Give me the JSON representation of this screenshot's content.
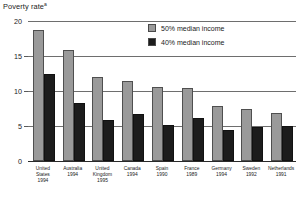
{
  "chart_data": {
    "type": "bar",
    "title": "Poverty rate",
    "title_superscript": "a",
    "xlabel": "",
    "ylabel": "Poverty rate",
    "ylim": [
      0,
      20
    ],
    "yticks": [
      0,
      5,
      10,
      15,
      20
    ],
    "ytick_labels": [
      "0",
      "5",
      "10",
      "15",
      "20"
    ],
    "grid": true,
    "legend_position": "top-right",
    "categories": [
      "United States 1994",
      "Australia 1994",
      "United Kingdom 1995",
      "Canada 1994",
      "Spain 1990",
      "France 1989",
      "Germany 1994",
      "Sweden 1992",
      "Netherlands 1991"
    ],
    "category_lines": [
      [
        "United",
        "States",
        "1994"
      ],
      [
        "Australia",
        "1994"
      ],
      [
        "United",
        "Kingdom",
        "1995"
      ],
      [
        "Canada",
        "1994"
      ],
      [
        "Spain",
        "1990"
      ],
      [
        "France",
        "1989"
      ],
      [
        "Germany",
        "1994"
      ],
      [
        "Sweden",
        "1992"
      ],
      [
        "Netherlands",
        "1991"
      ]
    ],
    "series": [
      {
        "name": "50% median income",
        "color": "#9a9a9a",
        "values": [
          18.7,
          15.8,
          12.0,
          11.4,
          10.6,
          10.5,
          7.9,
          7.5,
          6.9
        ]
      },
      {
        "name": "40% median income",
        "color": "#1c1c1c",
        "values": [
          12.5,
          8.3,
          5.9,
          6.7,
          5.2,
          6.1,
          4.4,
          4.9,
          5.0
        ]
      }
    ]
  },
  "legend": {
    "items": [
      {
        "label": "50% median income",
        "swatch": "light"
      },
      {
        "label": "40% median income",
        "swatch": "dark"
      }
    ]
  }
}
